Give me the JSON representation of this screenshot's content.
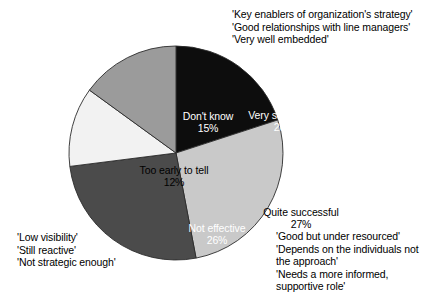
{
  "chart_data": {
    "type": "pie",
    "title": "",
    "subtitle": "",
    "xlabel": "",
    "ylabel": "",
    "legend_position": "none",
    "grid": false,
    "start_angle_deg": 0,
    "direction": "clockwise",
    "categories": [
      "Very successful",
      "Quite successful",
      "Not effective",
      "Too early to tell",
      "Don't know"
    ],
    "values": [
      20,
      27,
      26,
      12,
      15
    ],
    "value_labels": [
      "20%",
      "27%",
      "26%",
      "12%",
      "15%"
    ],
    "slices": [
      {
        "label": "Very successful",
        "value": 20,
        "value_label": "20%",
        "color": "#0d0d0d",
        "text_color": "#ffffff"
      },
      {
        "label": "Quite successful",
        "value": 27,
        "value_label": "27%",
        "color": "#c9c9c9",
        "text_color": "#000000"
      },
      {
        "label": "Not effective",
        "value": 26,
        "value_label": "26%",
        "color": "#4b4b4b",
        "text_color": "#ffffff"
      },
      {
        "label": "Too early to tell",
        "value": 12,
        "value_label": "12%",
        "color": "#f2f2f2",
        "text_color": "#000000"
      },
      {
        "label": "Don't know",
        "value": 15,
        "value_label": "15%",
        "color": "#9b9b9b",
        "text_color": "#ffffff"
      }
    ]
  },
  "annotations": {
    "top_right": {
      "lines": [
        "'Key enablers of organization's strategy'",
        "'Good relationships with line managers'",
        "'Very well embedded'"
      ]
    },
    "bottom_right": {
      "lines": [
        "'Good but under resourced'",
        "'Depends on the individuals not",
        "the approach'",
        "'Needs a more informed,",
        "supportive role'"
      ]
    },
    "bottom_left": {
      "lines": [
        "'Low visibility'",
        "'Still reactive'",
        "'Not strategic enough'"
      ]
    }
  }
}
